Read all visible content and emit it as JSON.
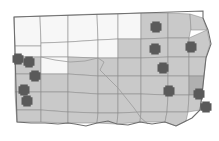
{
  "figure": {
    "title": "South Dakota county map",
    "subject": "South Dakota",
    "map_type": "choropleth-county-map-with-point-markers",
    "background_color": "#ffffff",
    "state_outline_color": "#6e6e6e",
    "county_border_color": "#8a8a8a",
    "shaded_county_color": "#c9c9c9",
    "unshaded_county_color": "#f7f7f7",
    "dark_county_color": "#b0b0b0",
    "marker_color": "#5a5a5a",
    "marker_shape": "plus-cross",
    "marker_count": 12
  },
  "markers": [
    {
      "id": "marker-1",
      "x": 18,
      "y": 59,
      "size": 11,
      "region": "west"
    },
    {
      "id": "marker-2",
      "x": 29,
      "y": 62,
      "size": 11,
      "region": "west"
    },
    {
      "id": "marker-3",
      "x": 35,
      "y": 76,
      "size": 11,
      "region": "west"
    },
    {
      "id": "marker-4",
      "x": 24,
      "y": 90,
      "size": 11,
      "region": "southwest"
    },
    {
      "id": "marker-5",
      "x": 27,
      "y": 101,
      "size": 11,
      "region": "southwest"
    },
    {
      "id": "marker-6",
      "x": 156,
      "y": 27,
      "size": 11,
      "region": "northeast"
    },
    {
      "id": "marker-7",
      "x": 155,
      "y": 49,
      "size": 11,
      "region": "northeast"
    },
    {
      "id": "marker-8",
      "x": 191,
      "y": 47,
      "size": 11,
      "region": "northeast-corner"
    },
    {
      "id": "marker-9",
      "x": 163,
      "y": 68,
      "size": 11,
      "region": "east-central"
    },
    {
      "id": "marker-10",
      "x": 169,
      "y": 91,
      "size": 11,
      "region": "southeast"
    },
    {
      "id": "marker-11",
      "x": 199,
      "y": 94,
      "size": 11,
      "region": "far-southeast"
    },
    {
      "id": "marker-12",
      "x": 206,
      "y": 107,
      "size": 11,
      "region": "far-southeast"
    }
  ],
  "counties": [
    {
      "id": "c-nw-1",
      "shade": "unshaded",
      "points": "14,17 40,16 41,46 15,46"
    },
    {
      "id": "c-nw-2",
      "shade": "unshaded",
      "points": "40,16 68,15 68,42 41,43"
    },
    {
      "id": "c-nw-3",
      "shade": "unshaded",
      "points": "68,15 97,14 98,40 68,42"
    },
    {
      "id": "c-nw-4",
      "shade": "unshaded",
      "points": "97,14 118,14 118,39 98,40"
    },
    {
      "id": "c-n-1",
      "shade": "unshaded",
      "points": "118,14 141,13 141,39 118,39"
    },
    {
      "id": "c-n-2",
      "shade": "shaded",
      "points": "141,13 168,13 168,38 141,39"
    },
    {
      "id": "c-n-3",
      "shade": "shaded",
      "points": "168,13 190,14 191,28 189,38 168,38"
    },
    {
      "id": "c-ne-1",
      "shade": "shaded",
      "points": "190,14 203,18 207,30 191,30"
    },
    {
      "id": "c-w-1",
      "shade": "unshaded",
      "points": "15,46 41,46 41,57 15,57"
    },
    {
      "id": "c-w-2",
      "shade": "unshaded",
      "points": "41,43 68,42 68,57 41,57"
    },
    {
      "id": "c-w-3",
      "shade": "unshaded",
      "points": "68,42 98,40 98,58 68,57"
    },
    {
      "id": "c-c-1",
      "shade": "unshaded",
      "points": "98,40 118,39 118,58 98,58"
    },
    {
      "id": "c-c-2",
      "shade": "shaded",
      "points": "118,39 141,39 141,58 118,58"
    },
    {
      "id": "c-c-3",
      "shade": "shaded",
      "points": "141,39 168,38 168,57 141,58"
    },
    {
      "id": "c-c-4",
      "shade": "shaded",
      "points": "168,38 189,38 189,57 168,57"
    },
    {
      "id": "c-ne-2",
      "shade": "shaded",
      "points": "189,38 207,30 210,44 206,57 189,57"
    },
    {
      "id": "c-w-4",
      "shade": "shaded",
      "points": "15,57 41,57 41,74 15,74"
    },
    {
      "id": "c-w-5",
      "shade": "unshaded",
      "points": "41,57 68,57 68,74 41,74"
    },
    {
      "id": "c-w-6",
      "shade": "shaded",
      "points": "68,57 98,58 98,76 68,74"
    },
    {
      "id": "c-c-5",
      "shade": "shaded",
      "points": "98,58 118,58 118,76 98,76"
    },
    {
      "id": "c-c-6",
      "shade": "shaded",
      "points": "118,58 141,58 141,76 118,76"
    },
    {
      "id": "c-c-7",
      "shade": "shaded",
      "points": "141,58 168,57 168,76 141,76"
    },
    {
      "id": "c-e-1",
      "shade": "shaded",
      "points": "168,57 189,57 189,76 168,76"
    },
    {
      "id": "c-e-2",
      "shade": "shaded",
      "points": "189,57 206,57 204,76 189,76"
    },
    {
      "id": "c-sw-1",
      "shade": "shaded",
      "points": "15,74 41,74 41,92 15,92"
    },
    {
      "id": "c-sw-2",
      "shade": "shaded",
      "points": "41,74 68,74 68,92 41,92"
    },
    {
      "id": "c-s-1",
      "shade": "shaded",
      "points": "68,74 98,76 98,94 68,92"
    },
    {
      "id": "c-s-2",
      "shade": "shaded",
      "points": "98,76 118,76 118,94 98,94"
    },
    {
      "id": "c-s-3",
      "shade": "shaded",
      "points": "118,76 141,76 141,94 118,94"
    },
    {
      "id": "c-s-4",
      "shade": "shaded",
      "points": "141,76 168,76 168,95 141,94"
    },
    {
      "id": "c-se-1",
      "shade": "shaded",
      "points": "168,76 189,76 189,95 168,95"
    },
    {
      "id": "c-se-2",
      "shade": "dark",
      "points": "189,76 204,76 202,95 189,95"
    },
    {
      "id": "c-sw-3",
      "shade": "shaded",
      "points": "15,92 41,92 41,110 16,110"
    },
    {
      "id": "c-sw-4",
      "shade": "shaded",
      "points": "41,92 68,92 68,112 41,110"
    },
    {
      "id": "c-s-5",
      "shade": "shaded",
      "points": "68,92 98,94 98,113 68,112"
    },
    {
      "id": "c-s-6",
      "shade": "shaded",
      "points": "98,94 118,94 118,113 98,113"
    },
    {
      "id": "c-s-7",
      "shade": "shaded",
      "points": "118,94 141,94 141,112 118,113"
    },
    {
      "id": "c-s-8",
      "shade": "shaded",
      "points": "141,94 168,95 167,112 141,112"
    },
    {
      "id": "c-se-3",
      "shade": "shaded",
      "points": "168,95 189,95 188,112 167,112"
    },
    {
      "id": "c-se-4",
      "shade": "shaded",
      "points": "189,95 202,95 200,110 188,112"
    },
    {
      "id": "c-s-9",
      "shade": "shaded",
      "points": "16,110 41,110 41,122 17,122"
    },
    {
      "id": "c-s-10",
      "shade": "shaded",
      "points": "41,110 68,112 68,123 41,122"
    },
    {
      "id": "c-s-11",
      "shade": "shaded",
      "points": "68,112 98,113 97,123 68,123"
    },
    {
      "id": "c-s-12",
      "shade": "shaded",
      "points": "98,113 118,113 117,124 97,123"
    },
    {
      "id": "c-s-13",
      "shade": "shaded",
      "points": "118,113 141,112 140,122 117,124"
    },
    {
      "id": "c-s-14",
      "shade": "shaded",
      "points": "141,112 167,112 165,122 140,122"
    },
    {
      "id": "c-s-15",
      "shade": "shaded",
      "points": "167,112 188,112 186,121 176,126 165,122"
    }
  ],
  "state_outline": {
    "path": "M14,17 L203,11 L203,18 L208,30 L211,44 L206,58 L204,76 L202,95 L200,110 L192,118 L186,121 L176,126 L165,122 L152,124 L140,122 L128,125 L117,124 L108,121 L97,123 L86,126 L75,124 L68,123 L58,124 L45,123 L31,123 L17,122 Z"
  },
  "rivers": [
    {
      "id": "missouri-river",
      "path": "M98,58 L104,62 L100,70 L108,78 L118,88 L126,98 L134,108 L141,118 L148,124"
    },
    {
      "id": "cheyenne-river",
      "path": "M41,57 L55,60 L70,62 L85,61 L98,58"
    }
  ]
}
